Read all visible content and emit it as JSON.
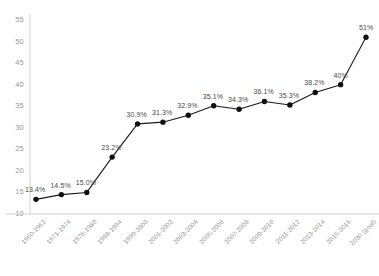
{
  "chart_data": {
    "type": "line",
    "title": "",
    "subtitle": "",
    "xlabel": "",
    "ylabel": "",
    "ylim": [
      10,
      55
    ],
    "yticks": [
      10,
      15,
      20,
      25,
      30,
      35,
      40,
      45,
      50,
      55
    ],
    "grid": false,
    "legend": "none",
    "marker": "filled-circle",
    "line_color": "#1a1a1a",
    "marker_color": "#111111",
    "label_color": "#4a4a4a",
    "axis_color": "#d0d0d0",
    "tick_label_color": "#9a9a9a",
    "categories": [
      "1960-1962",
      "1971-1974",
      "1976-1980",
      "1988-1994",
      "1999-2000",
      "2001-2002",
      "2003-2004",
      "2005-2006",
      "2007-2008",
      "2009-2010",
      "2011-2012",
      "2013-2014",
      "2015-2016",
      "2030 (goal)"
    ],
    "values": [
      13.4,
      14.5,
      15.0,
      23.2,
      30.9,
      31.3,
      32.9,
      35.1,
      34.3,
      36.1,
      35.3,
      38.2,
      40,
      51
    ],
    "data_labels": [
      "13.4%",
      "14.5%",
      "15.0%",
      "23.2%",
      "30.9%",
      "31.3%",
      "32.9%",
      "35.1%",
      "34.3%",
      "36.1%",
      "35.3%",
      "38.2%",
      "40%",
      "51%"
    ]
  }
}
